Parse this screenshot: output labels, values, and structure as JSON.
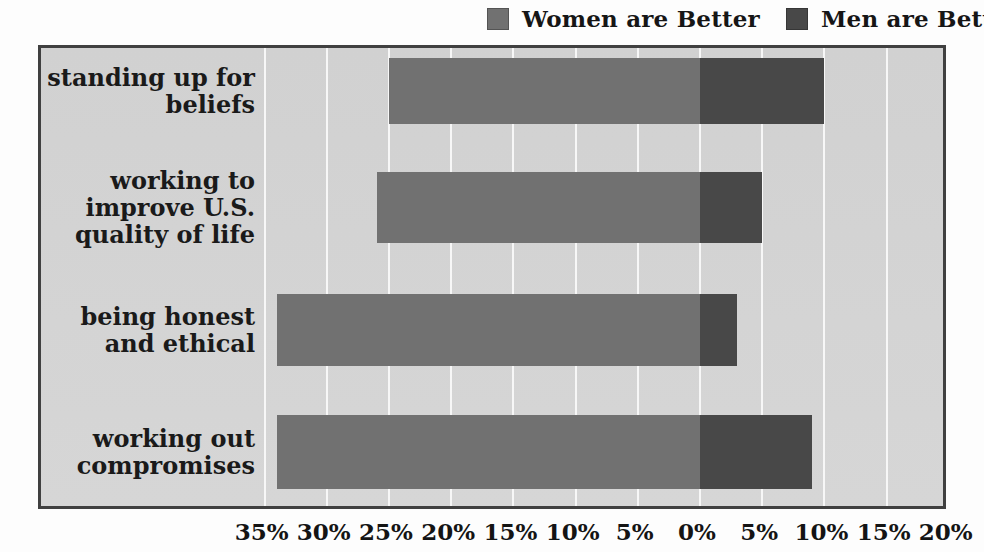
{
  "legend": {
    "items": [
      {
        "label": "Women are Better",
        "color": "#717171"
      },
      {
        "label": "Men are Better",
        "color": "#484848"
      }
    ]
  },
  "chart_data": {
    "type": "bar",
    "subtype": "horizontal-diverging",
    "title": "",
    "categories": [
      "standing up for beliefs",
      "working to improve U.S.\nquality of life",
      "being honest and ethical",
      "working out compromises"
    ],
    "series": [
      {
        "name": "Women are Better",
        "direction": "left",
        "color": "#717171",
        "values": [
          25,
          26,
          34,
          34
        ]
      },
      {
        "name": "Men are Better",
        "direction": "right",
        "color": "#484848",
        "values": [
          10,
          5,
          3,
          9
        ]
      }
    ],
    "x_ticks": [
      {
        "label": "35%",
        "value": -35
      },
      {
        "label": "30%",
        "value": -30
      },
      {
        "label": "25%",
        "value": -25
      },
      {
        "label": "20%",
        "value": -20
      },
      {
        "label": "15%",
        "value": -15
      },
      {
        "label": "10%",
        "value": -10
      },
      {
        "label": "5%",
        "value": -5
      },
      {
        "label": "0%",
        "value": 0
      },
      {
        "label": "5%",
        "value": 5
      },
      {
        "label": "10%",
        "value": 10
      },
      {
        "label": "15%",
        "value": 15
      },
      {
        "label": "20%",
        "value": 20
      }
    ],
    "xlim": [
      -53,
      20
    ],
    "grid": "vertical white gridlines at labeled ticks",
    "legend_position": "top",
    "plot_background": "#d3d3d3",
    "unit": "percent"
  },
  "colors": {
    "page_bg": "#fdfdfd",
    "plot_bg": "#d3d3d3",
    "plot_border": "#404040",
    "gridline": "#f7f7f7",
    "text": "#1a1a1a"
  }
}
